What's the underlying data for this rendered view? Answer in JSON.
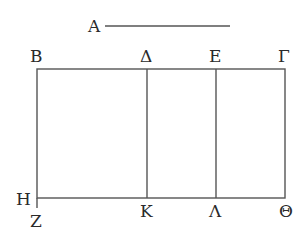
{
  "diagram": {
    "labels": {
      "A": "A",
      "B": "Β",
      "Delta": "Δ",
      "E": "Ε",
      "Gamma": "Γ",
      "H": "Η",
      "Z": "Ζ",
      "K": "Κ",
      "Lambda": "Λ",
      "Theta": "Θ"
    },
    "line_color": "#555555",
    "text_color": "#2a2a2a"
  }
}
